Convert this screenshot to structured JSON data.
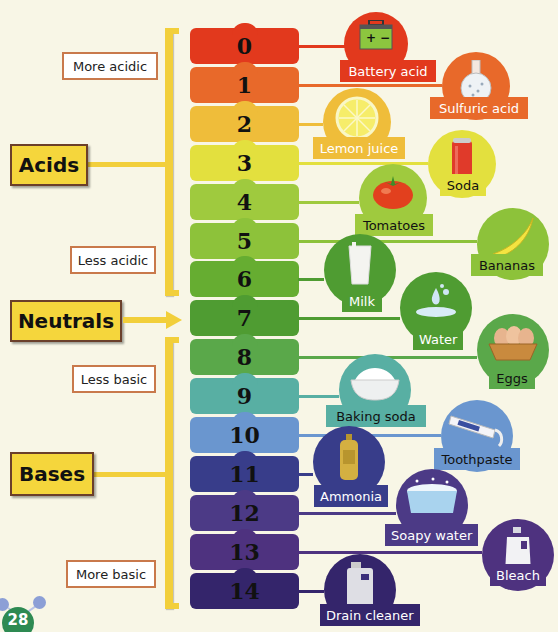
{
  "header": {
    "partial_title": ""
  },
  "categories": {
    "acids": "Acids",
    "neutrals": "Neutrals",
    "bases": "Bases"
  },
  "hints": {
    "more_acidic": "More acidic",
    "less_acidic": "Less acidic",
    "less_basic": "Less basic",
    "more_basic": "More basic"
  },
  "scale": [
    {
      "value": "0",
      "color": "#e2391d"
    },
    {
      "value": "1",
      "color": "#e8692a"
    },
    {
      "value": "2",
      "color": "#efbd3a"
    },
    {
      "value": "3",
      "color": "#e3e03e"
    },
    {
      "value": "4",
      "color": "#9fca3e"
    },
    {
      "value": "5",
      "color": "#8dc23a"
    },
    {
      "value": "6",
      "color": "#66ad31"
    },
    {
      "value": "7",
      "color": "#4f9c32"
    },
    {
      "value": "8",
      "color": "#5aa84a"
    },
    {
      "value": "9",
      "color": "#58afa3"
    },
    {
      "value": "10",
      "color": "#6a96cf"
    },
    {
      "value": "11",
      "color": "#383d8a"
    },
    {
      "value": "12",
      "color": "#4c3a86"
    },
    {
      "value": "13",
      "color": "#4e327f"
    },
    {
      "value": "14",
      "color": "#34256b"
    }
  ],
  "examples": [
    {
      "label": "Battery acid",
      "icon": "battery-icon",
      "ph": "0",
      "color": "#e2391d"
    },
    {
      "label": "Sulfuric acid",
      "icon": "flask-icon",
      "ph": "1",
      "color": "#e8692a"
    },
    {
      "label": "Lemon juice",
      "icon": "lemon-icon",
      "ph": "2",
      "color": "#efbd3a"
    },
    {
      "label": "Soda",
      "icon": "soda-can-icon",
      "ph": "3",
      "color": "#e3e03e"
    },
    {
      "label": "Tomatoes",
      "icon": "tomato-icon",
      "ph": "4",
      "color": "#9fca3e"
    },
    {
      "label": "Bananas",
      "icon": "banana-icon",
      "ph": "5",
      "color": "#8dc23a"
    },
    {
      "label": "Milk",
      "icon": "milk-glass-icon",
      "ph": "6",
      "color": "#4f9c32"
    },
    {
      "label": "Water",
      "icon": "water-drop-icon",
      "ph": "7",
      "color": "#4f9c32"
    },
    {
      "label": "Eggs",
      "icon": "egg-basket-icon",
      "ph": "8",
      "color": "#5aa84a"
    },
    {
      "label": "Baking soda",
      "icon": "powder-bowl-icon",
      "ph": "9",
      "color": "#58afa3"
    },
    {
      "label": "Toothpaste",
      "icon": "toothpaste-icon",
      "ph": "10",
      "color": "#6a96cf"
    },
    {
      "label": "Ammonia",
      "icon": "ammonia-bottle-icon",
      "ph": "11",
      "color": "#383d8a"
    },
    {
      "label": "Soapy water",
      "icon": "soap-tub-icon",
      "ph": "12",
      "color": "#4c3a86"
    },
    {
      "label": "Bleach",
      "icon": "bleach-jug-icon",
      "ph": "13",
      "color": "#4e327f"
    },
    {
      "label": "Drain cleaner",
      "icon": "drain-cleaner-icon",
      "ph": "14",
      "color": "#34256b"
    }
  ],
  "page_number": "28"
}
